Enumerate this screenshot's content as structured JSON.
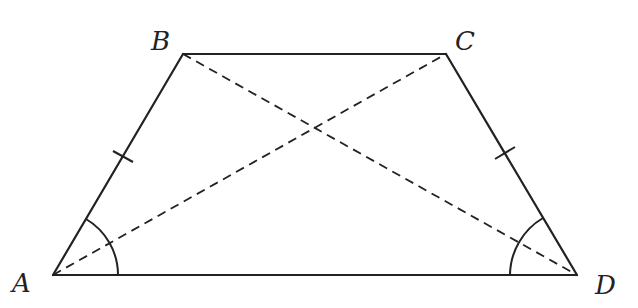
{
  "diagram": {
    "type": "isosceles-trapezoid",
    "vertices": [
      {
        "name": "A",
        "x": 53,
        "y": 275,
        "label_x": 12,
        "label_y": 292
      },
      {
        "name": "B",
        "x": 183,
        "y": 54,
        "label_x": 151,
        "label_y": 50
      },
      {
        "name": "C",
        "x": 446,
        "y": 54,
        "label_x": 455,
        "label_y": 50
      },
      {
        "name": "D",
        "x": 577,
        "y": 275,
        "label_x": 595,
        "label_y": 294
      }
    ],
    "sides": [
      "AB",
      "BC",
      "CD",
      "DA"
    ],
    "diagonals": [
      "AC",
      "BD"
    ],
    "equal_sides": [
      "AB",
      "CD"
    ],
    "equal_angles": [
      "A",
      "D"
    ],
    "colors": {
      "stroke": "#222222",
      "background": "#ffffff"
    }
  }
}
